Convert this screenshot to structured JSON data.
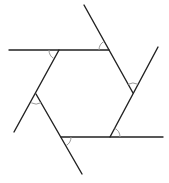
{
  "diagram": {
    "line_color": "#222222",
    "arc_color": "#999999",
    "vertices": {
      "top_left": [
        59,
        50
      ],
      "top_right": [
        109,
        50
      ],
      "right": [
        133,
        93
      ],
      "bottom_right": [
        110,
        137
      ],
      "bottom_left": [
        61,
        137
      ],
      "left": [
        36,
        94
      ]
    },
    "lines": [
      {
        "name": "top-side-extended",
        "x1": 9,
        "y1": 50,
        "x2": 109,
        "y2": 50
      },
      {
        "name": "upper-right-side-extended",
        "x1": 84,
        "y1": 5,
        "x2": 133,
        "y2": 93
      },
      {
        "name": "lower-right-side-extended",
        "x1": 158,
        "y1": 47,
        "x2": 110,
        "y2": 137
      },
      {
        "name": "bottom-side-extended",
        "x1": 61,
        "y1": 137,
        "x2": 163,
        "y2": 137
      },
      {
        "name": "lower-left-side-extended",
        "x1": 36,
        "y1": 94,
        "x2": 82,
        "y2": 174
      },
      {
        "name": "upper-left-side-extended",
        "x1": 59,
        "y1": 50,
        "x2": 14,
        "y2": 132
      }
    ],
    "angle_arcs": [
      {
        "name": "angle-arc-top-left",
        "d": "M 49 50 A 10 10 0 0 0 54 58.7"
      },
      {
        "name": "angle-arc-top-right",
        "d": "M 99 50 A 10 10 0 0 1 104.2 41.3"
      },
      {
        "name": "angle-arc-right",
        "d": "M 128.1 84.3 A 10 10 0 0 1 137.7 84.2"
      },
      {
        "name": "angle-arc-bottom-right",
        "d": "M 120 137 A 10 10 0 0 0 114.7 128.2"
      },
      {
        "name": "angle-arc-bottom-left",
        "d": "M 71 137 A 10 10 0 0 1 66 145.7"
      },
      {
        "name": "angle-arc-left",
        "d": "M 31.2 102.8 A 10 10 0 0 0 41 102.7"
      }
    ]
  }
}
